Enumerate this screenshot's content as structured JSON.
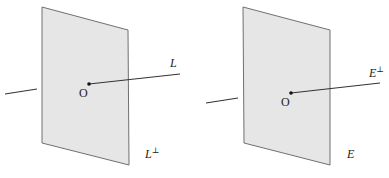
{
  "figure": {
    "panels": [
      {
        "id": "left",
        "origin_label": "O",
        "line_label": "L",
        "plane_label_base": "L",
        "plane_label_sup": "⊥"
      },
      {
        "id": "right",
        "origin_label": "O",
        "line_label_base": "E",
        "line_label_sup": "⊥",
        "plane_label": "E"
      }
    ],
    "colors": {
      "plane_fill": "#e6e6e6",
      "plane_edge": "#707070",
      "line": "#333333"
    }
  }
}
